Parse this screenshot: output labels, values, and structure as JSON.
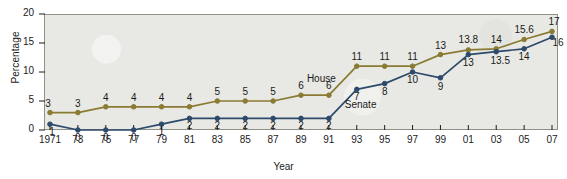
{
  "chart_data": {
    "type": "line",
    "title": "",
    "xlabel": "Year",
    "ylabel": "Percentage",
    "xlim": [
      1971,
      2007
    ],
    "ylim": [
      0,
      20
    ],
    "yticks": [
      0,
      5,
      10,
      15,
      20
    ],
    "grid": false,
    "legend_position": "inline-annotation",
    "categories": [
      "1971",
      "73",
      "75",
      "77",
      "79",
      "81",
      "83",
      "85",
      "87",
      "89",
      "91",
      "93",
      "95",
      "97",
      "99",
      "01",
      "03",
      "05",
      "07"
    ],
    "x": [
      1971,
      1973,
      1975,
      1977,
      1979,
      1981,
      1983,
      1985,
      1987,
      1989,
      1991,
      1993,
      1995,
      1997,
      1999,
      2001,
      2003,
      2005,
      2007
    ],
    "series": [
      {
        "name": "House",
        "color": "#8a7b33",
        "values": [
          3,
          3,
          4,
          4,
          4,
          4,
          5,
          5,
          5,
          6,
          6,
          11,
          11,
          11,
          13,
          13.8,
          14,
          15.6,
          17
        ],
        "labels": [
          "3",
          "3",
          "4",
          "4",
          "4",
          "4",
          "5",
          "5",
          "5",
          "6",
          "6",
          "11",
          "11",
          "11",
          "13",
          "13.8",
          "14",
          "15.6",
          "17"
        ]
      },
      {
        "name": "Senate",
        "color": "#2d4a6b",
        "values": [
          1,
          0,
          0,
          0,
          1,
          2,
          2,
          2,
          2,
          2,
          2,
          7,
          8,
          10,
          9,
          13,
          13.5,
          14,
          16
        ],
        "labels": [
          "1",
          "0",
          "0",
          "0",
          "1",
          "2",
          "2",
          "2",
          "2",
          "2",
          "2",
          "7",
          "8",
          "10",
          "9",
          "13",
          "13.5",
          "14",
          "16"
        ]
      }
    ],
    "annotations": [
      {
        "text": "House",
        "series": "House"
      },
      {
        "text": "Senate",
        "series": "Senate"
      }
    ]
  },
  "colors": {
    "house": "#8a7b33",
    "senate": "#2d4a6b",
    "panel_background": "#e8e9e4",
    "panel_border": "#8e9089",
    "text": "#1b1b1b",
    "page_background": "#ffffff"
  }
}
